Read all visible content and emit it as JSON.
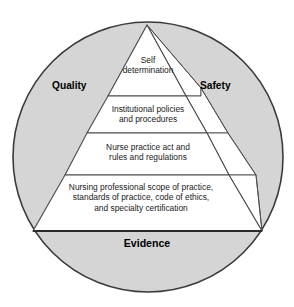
{
  "diagram": {
    "type": "pyramid-in-circle",
    "colors": {
      "circle_fill": "#d5d5d5",
      "circle_stroke": "#3a3a3a",
      "pyramid_fill": "#ffffff",
      "pyramid_stroke": "#4a4a4a",
      "side_face_fill": "#fdfdfd",
      "text": "#1a1a1a",
      "label_text": "#000000"
    },
    "circle": {
      "cx": 148,
      "cy": 157,
      "r": 136
    },
    "corner_labels": {
      "left": "Quality",
      "right": "Safety",
      "bottom": "Evidence"
    },
    "tiers": [
      {
        "index": 1,
        "name": "self-determination",
        "text": "Self\ndetermination"
      },
      {
        "index": 2,
        "name": "institutional-policies",
        "text": "Institutional policies\nand procedures"
      },
      {
        "index": 3,
        "name": "nurse-practice-act",
        "text": "Nurse practice act and\nrules and regulations"
      },
      {
        "index": 4,
        "name": "professional-scope",
        "text": "Nursing professional scope of practice,\nstandards of practice, code of ethics,\nand specialty certification"
      }
    ]
  }
}
